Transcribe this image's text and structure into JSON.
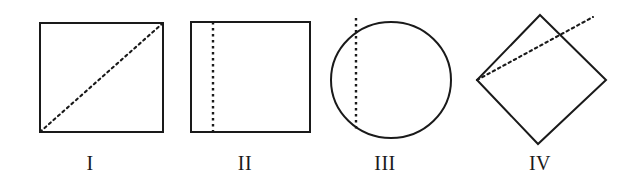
{
  "page": {
    "background_color": "#ffffff",
    "stroke_color": "#1a1a1a",
    "dash_color": "#1a1a1a",
    "width": 634,
    "height": 187
  },
  "figures": [
    {
      "id": "figure-1",
      "label": "I",
      "shape": "square",
      "dashed_line": "diagonal",
      "label_x": 90,
      "label_y": 163,
      "geometry": {
        "x": 40,
        "y": 23,
        "width": 123,
        "height": 109,
        "dash_x1": 40,
        "dash_y1": 132,
        "dash_x2": 163,
        "dash_y2": 23
      }
    },
    {
      "id": "figure-2",
      "label": "II",
      "shape": "square",
      "dashed_line": "vertical-off-center",
      "label_x": 245,
      "label_y": 163,
      "geometry": {
        "x": 191,
        "y": 22,
        "width": 119,
        "height": 110,
        "dash_x1": 213,
        "dash_y1": 22,
        "dash_x2": 213,
        "dash_y2": 132
      }
    },
    {
      "id": "figure-3",
      "label": "III",
      "shape": "circle",
      "dashed_line": "vertical-chord",
      "label_x": 385,
      "label_y": 163,
      "geometry": {
        "cx": 391,
        "cy": 80,
        "rx": 60,
        "ry": 58,
        "dash_x1": 356,
        "dash_y1": 18,
        "dash_x2": 356,
        "dash_y2": 130
      }
    },
    {
      "id": "figure-4",
      "label": "IV",
      "shape": "diamond",
      "dashed_line": "ray-from-left-vertex",
      "label_x": 540,
      "label_y": 163,
      "geometry": {
        "top_x": 540,
        "top_y": 15,
        "right_x": 606,
        "right_y": 80,
        "bottom_x": 538,
        "bottom_y": 144,
        "left_x": 477,
        "left_y": 80,
        "dash_x1": 477,
        "dash_y1": 80,
        "dash_x2": 593,
        "dash_y2": 17
      }
    }
  ]
}
